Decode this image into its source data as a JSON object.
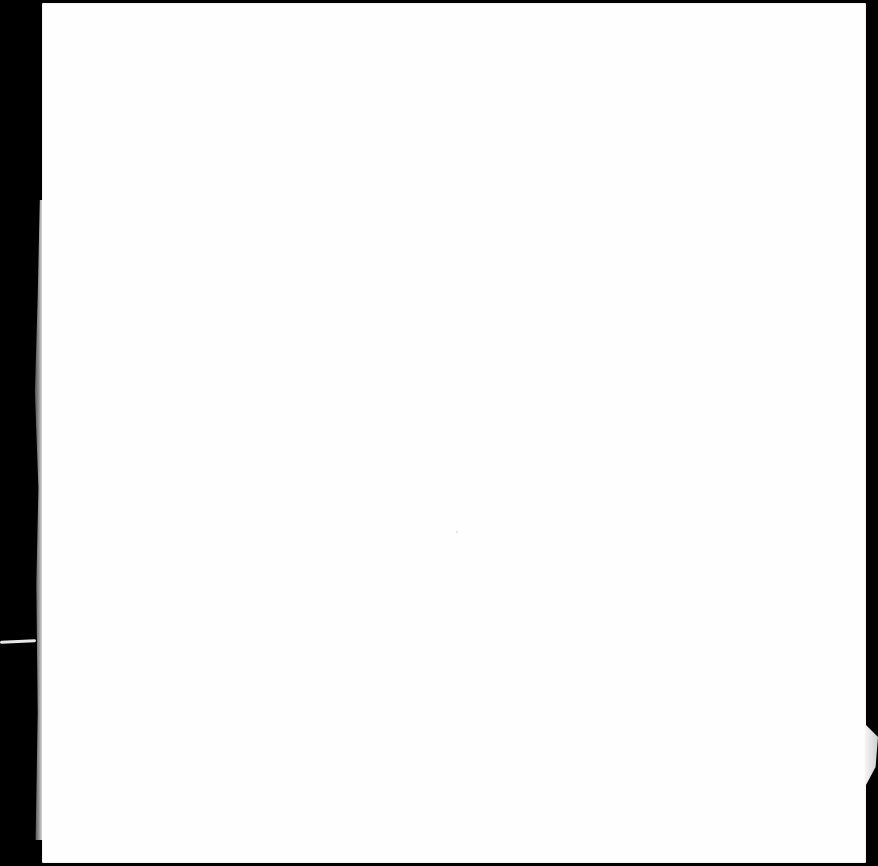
{
  "document": {
    "type": "scanned-blank-page",
    "text": ""
  },
  "colors": {
    "background": "#000000",
    "page": "#fefefe"
  }
}
